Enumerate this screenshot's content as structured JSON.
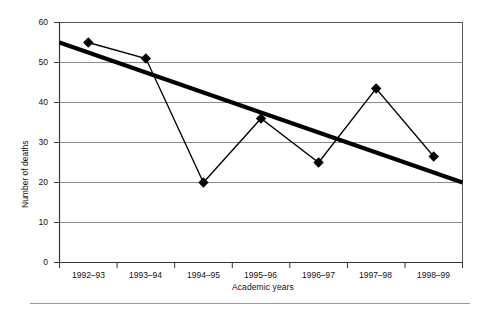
{
  "chart_data": {
    "type": "line",
    "title": "",
    "xlabel": "Academic years",
    "ylabel": "Number of deaths",
    "categories": [
      "1992–93",
      "1993–94",
      "1994–95",
      "1995–96",
      "1996–97",
      "1997–98",
      "1998–99"
    ],
    "ylim": [
      0,
      60
    ],
    "yticks": [
      0,
      10,
      20,
      30,
      40,
      50,
      60
    ],
    "ytick_labels": [
      "0",
      "10",
      "20",
      "30",
      "40",
      "50",
      "60"
    ],
    "grid": true,
    "legend": "none",
    "series": [
      {
        "name": "Number of deaths",
        "type": "line",
        "marker": "diamond",
        "color": "#000000",
        "values": [
          55,
          51,
          20,
          36,
          25,
          43.5,
          26.5
        ]
      },
      {
        "name": "Linear trend",
        "type": "trendline",
        "marker": "none",
        "color": "#000000",
        "endpoints": [
          55,
          20
        ]
      }
    ]
  },
  "axes": {
    "y_title": "Number of deaths",
    "x_title": "Academic years"
  }
}
